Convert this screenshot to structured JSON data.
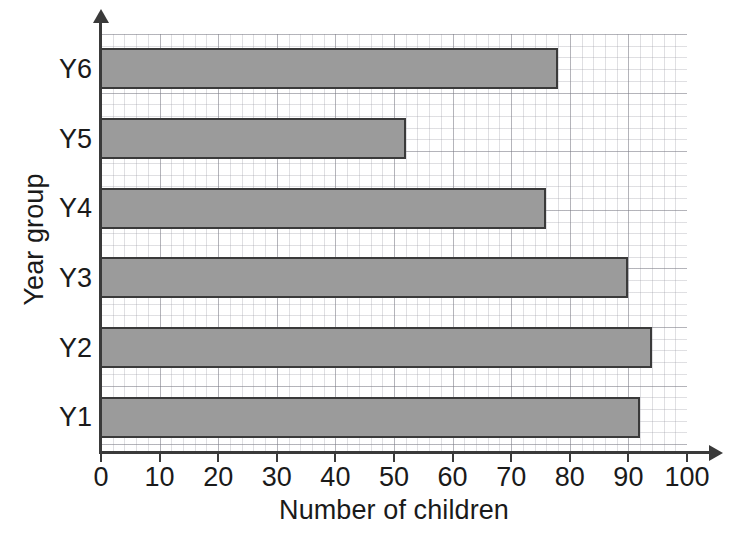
{
  "chart_data": {
    "type": "bar",
    "orientation": "horizontal",
    "title": "",
    "xlabel": "Number of children",
    "ylabel": "Year group",
    "categories": [
      "Y1",
      "Y2",
      "Y3",
      "Y4",
      "Y5",
      "Y6"
    ],
    "values": [
      92,
      94,
      90,
      76,
      52,
      78
    ],
    "xlim": [
      0,
      100
    ],
    "xticks": [
      0,
      10,
      20,
      30,
      40,
      50,
      60,
      70,
      80,
      90,
      100
    ],
    "xtick_labels": [
      "0",
      "10",
      "20",
      "30",
      "40",
      "50",
      "60",
      "70",
      "80",
      "90",
      "100"
    ],
    "grid": true,
    "grid_minor_step": 2,
    "grid_major_step": 10,
    "legend": false,
    "bar_fill_color": "#9b9b9b",
    "bar_edge_color": "#3a3a3a",
    "axis_color": "#3a3a3a",
    "text_color": "#1a1a1a",
    "background_color": "#ffffff"
  },
  "axes": {
    "x_title": "Number of children",
    "y_title": "Year group"
  }
}
